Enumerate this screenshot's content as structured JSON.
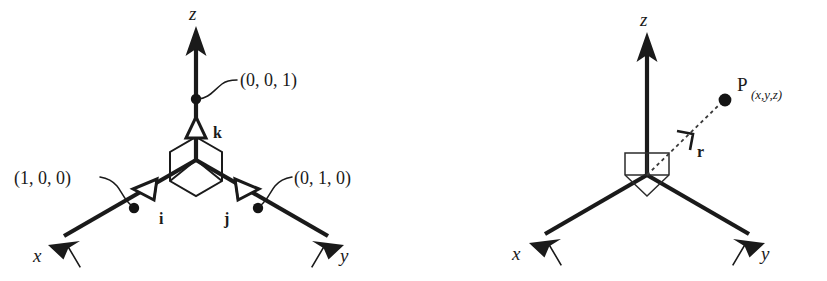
{
  "figure": {
    "name": "cartesian-coordinate-system-diagrams",
    "background_color": "#ffffff",
    "ink_color": "#1a1a1a",
    "panel_count": 2
  },
  "panels": [
    {
      "id": "unit-vectors",
      "name": "Cartesian axes with unit vectors i, j, k",
      "axes": {
        "x_label": "x",
        "y_label": "y",
        "z_label": "z"
      },
      "unit_vectors": [
        {
          "symbol": "i",
          "axis": "x",
          "coordinate_label": "(1, 0, 0)"
        },
        {
          "symbol": "j",
          "axis": "y",
          "coordinate_label": "(0, 1, 0)"
        },
        {
          "symbol": "k",
          "axis": "z",
          "coordinate_label": "(0, 0, 1)"
        }
      ],
      "origin_marker": "isometric-cube-corner"
    },
    {
      "id": "position-vector",
      "name": "Cartesian axes with position vector r to point P",
      "axes": {
        "x_label": "x",
        "y_label": "y",
        "z_label": "z"
      },
      "point": {
        "symbol": "P",
        "subscript": "(x,y,z)"
      },
      "vector": {
        "symbol": "r",
        "style": "dotted",
        "from": "origin",
        "to": "P"
      },
      "origin_marker": "isometric-cube-corner"
    }
  ]
}
